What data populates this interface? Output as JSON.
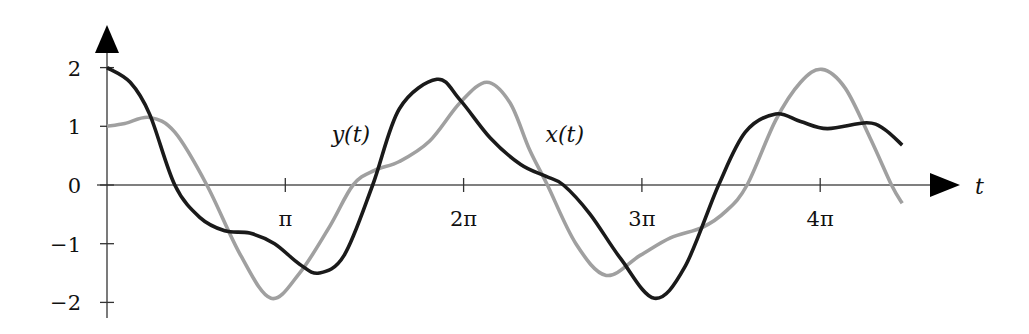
{
  "chart_data": {
    "type": "line",
    "title": "",
    "xlabel": "t",
    "ylabel": "",
    "x_unit": "pi",
    "xlim": [
      0,
      5.05
    ],
    "ylim": [
      -2.25,
      2.6
    ],
    "grid": false,
    "legend": "inline labels",
    "x_ticks": [
      {
        "value": 1,
        "label": "π"
      },
      {
        "value": 2,
        "label": "2π"
      },
      {
        "value": 3,
        "label": "3π"
      },
      {
        "value": 4,
        "label": "4π"
      }
    ],
    "y_ticks": [
      {
        "value": 2,
        "label": "2"
      },
      {
        "value": 1,
        "label": "1"
      },
      {
        "value": 0,
        "label": "0"
      },
      {
        "value": -1,
        "label": "−1"
      },
      {
        "value": -2,
        "label": "−2"
      }
    ],
    "series": [
      {
        "name": "y(t)",
        "color": "#1a1a1a",
        "label": "y(t)",
        "label_pos": {
          "t_over_pi": 1.26,
          "value": 0.8
        },
        "points_t_over_pi": [
          0.0,
          0.13,
          0.24,
          0.38,
          0.52,
          0.66,
          0.8,
          0.94,
          1.08,
          1.19,
          1.33,
          1.49,
          1.64,
          1.85,
          1.98,
          2.15,
          2.32,
          2.46,
          2.56,
          2.71,
          2.88,
          3.07,
          3.24,
          3.43,
          3.58,
          3.75,
          3.89,
          4.04,
          4.26,
          4.36,
          4.46
        ],
        "values": [
          2.0,
          1.75,
          1.2,
          0.0,
          -0.55,
          -0.78,
          -0.82,
          -1.0,
          -1.35,
          -1.5,
          -1.2,
          0.0,
          1.3,
          1.8,
          1.45,
          0.8,
          0.35,
          0.15,
          0.0,
          -0.5,
          -1.25,
          -1.93,
          -1.4,
          0.0,
          0.9,
          1.21,
          1.08,
          0.96,
          1.06,
          0.95,
          0.68
        ]
      },
      {
        "name": "x(t)",
        "color": "#a0a0a0",
        "label": "x(t)",
        "label_pos": {
          "t_over_pi": 2.46,
          "value": 0.8
        },
        "points_t_over_pi": [
          0.0,
          0.1,
          0.24,
          0.38,
          0.56,
          0.75,
          0.92,
          1.08,
          1.25,
          1.38,
          1.5,
          1.64,
          1.81,
          1.98,
          2.13,
          2.26,
          2.37,
          2.47,
          2.63,
          2.8,
          2.99,
          3.16,
          3.34,
          3.47,
          3.59,
          3.75,
          3.89,
          4.01,
          4.14,
          4.28,
          4.4,
          4.46
        ],
        "values": [
          1.0,
          1.05,
          1.15,
          0.9,
          0.0,
          -1.2,
          -1.93,
          -1.5,
          -0.7,
          0.0,
          0.25,
          0.4,
          0.75,
          1.4,
          1.75,
          1.4,
          0.6,
          0.0,
          -1.0,
          -1.54,
          -1.2,
          -0.9,
          -0.72,
          -0.45,
          0.0,
          1.1,
          1.75,
          1.97,
          1.65,
          0.8,
          0.0,
          -0.31
        ]
      }
    ]
  },
  "axes": {
    "x_axis_label": "t",
    "axis_color": "#1a1a1a"
  }
}
